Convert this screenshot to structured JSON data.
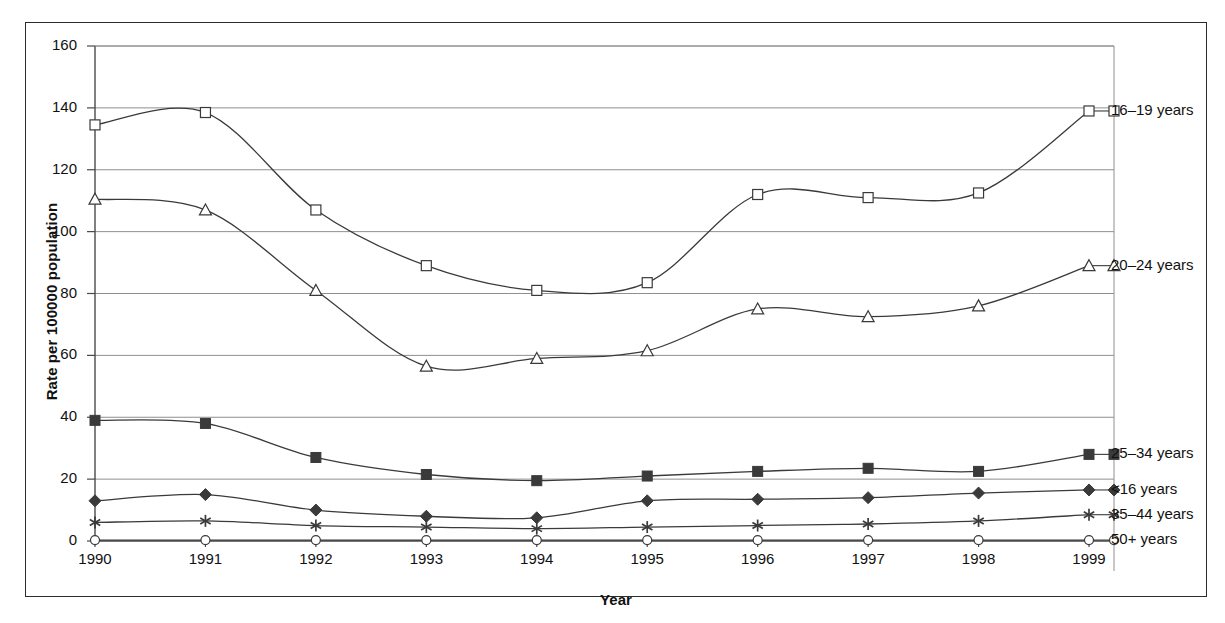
{
  "chart_data": {
    "type": "line",
    "title": "",
    "xlabel": "Year",
    "ylabel": "Rate per 100000 population",
    "categories": [
      1990,
      1991,
      1992,
      1993,
      1994,
      1995,
      1996,
      1997,
      1998,
      1999
    ],
    "xtick_labels": [
      "1990",
      "1991",
      "1992",
      "1993",
      "1994",
      "1995",
      "1996",
      "1997",
      "1998",
      "1999"
    ],
    "ytick_labels": [
      "0",
      "20",
      "40",
      "60",
      "80",
      "100",
      "120",
      "140",
      "160"
    ],
    "yticks": [
      0,
      20,
      40,
      60,
      80,
      100,
      120,
      140,
      160
    ],
    "ylim": [
      0,
      160
    ],
    "xlim": [
      1990,
      1999
    ],
    "grid": "horizontal",
    "legend_position": "right-inline-labels",
    "series": [
      {
        "name": "16–19 years",
        "marker": "open-square",
        "values": [
          134.5,
          138.5,
          107.0,
          89.0,
          81.0,
          83.5,
          112.0,
          111.0,
          112.5,
          139.0
        ]
      },
      {
        "name": "20–24 years",
        "marker": "open-triangle",
        "values": [
          110.5,
          107.0,
          81.0,
          56.5,
          59.0,
          61.5,
          75.0,
          72.5,
          76.0,
          89.0
        ]
      },
      {
        "name": "25–34 years",
        "marker": "filled-square",
        "values": [
          39.0,
          38.0,
          27.0,
          21.5,
          19.5,
          21.0,
          22.5,
          23.5,
          22.5,
          28.0
        ]
      },
      {
        "name": "<16 years",
        "marker": "filled-diamond",
        "values": [
          13.0,
          15.0,
          10.0,
          8.0,
          7.5,
          13.0,
          13.5,
          14.0,
          15.5,
          16.5
        ]
      },
      {
        "name": "35–44 years",
        "marker": "asterisk",
        "values": [
          6.0,
          6.5,
          5.0,
          4.5,
          4.0,
          4.5,
          5.0,
          5.5,
          6.5,
          8.5
        ]
      },
      {
        "name": "50+ years",
        "marker": "open-circle",
        "values": [
          0.3,
          0.3,
          0.3,
          0.3,
          0.3,
          0.3,
          0.3,
          0.3,
          0.3,
          0.3
        ]
      }
    ],
    "colors": {
      "line": "#3a3a3a",
      "grid": "#8f8f8f",
      "axis": "#4a4a4a",
      "frame": "#2b2b2b",
      "marker_fill_open": "#ffffff",
      "marker_fill_solid": "#3a3a3a",
      "text": "#111111",
      "background": "#ffffff"
    }
  }
}
